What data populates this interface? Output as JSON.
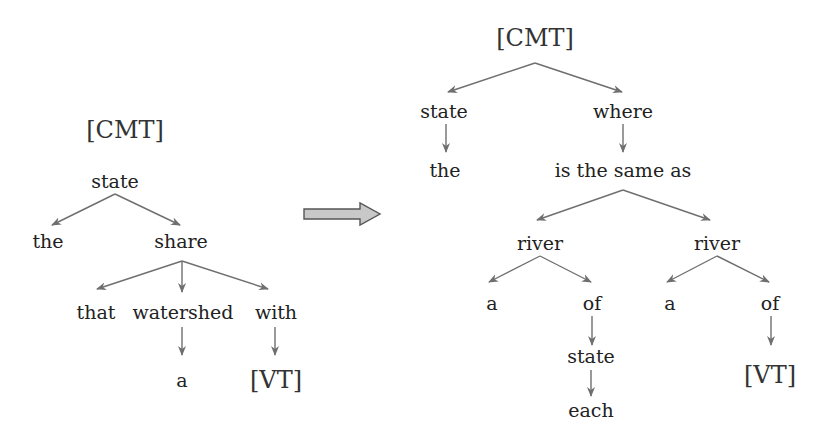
{
  "colors": {
    "edge": "#6f6f6f",
    "arrow_fill": "#c4c4c4",
    "arrow_stroke": "#555555",
    "text": "#222222"
  },
  "left_tree": {
    "label": "[CMT]",
    "nodes": [
      {
        "id": "l_root",
        "text": "state",
        "x": 115,
        "y": 181
      },
      {
        "id": "l_the",
        "text": "the",
        "x": 48,
        "y": 241
      },
      {
        "id": "l_share",
        "text": "share",
        "x": 181,
        "y": 241
      },
      {
        "id": "l_that",
        "text": "that",
        "x": 96,
        "y": 312
      },
      {
        "id": "l_watershed",
        "text": "watershed",
        "x": 183,
        "y": 312
      },
      {
        "id": "l_with",
        "text": "with",
        "x": 276,
        "y": 312
      },
      {
        "id": "l_a",
        "text": "a",
        "x": 182,
        "y": 380
      },
      {
        "id": "l_vt",
        "text": "[VT]",
        "x": 276,
        "y": 380,
        "big": true
      }
    ],
    "edges": [
      {
        "from": [
          115,
          194
        ],
        "to": [
          52,
          225
        ]
      },
      {
        "from": [
          115,
          194
        ],
        "to": [
          180,
          225
        ]
      },
      {
        "from": [
          182,
          261
        ],
        "to": [
          97,
          289
        ]
      },
      {
        "from": [
          182,
          261
        ],
        "to": [
          182,
          292
        ]
      },
      {
        "from": [
          182,
          261
        ],
        "to": [
          268,
          289
        ]
      },
      {
        "from": [
          182,
          327
        ],
        "to": [
          182,
          355
        ]
      },
      {
        "from": [
          275,
          327
        ],
        "to": [
          275,
          355
        ]
      }
    ]
  },
  "transform_arrow": {
    "label": "transform-arrow"
  },
  "right_tree": {
    "nodes": [
      {
        "id": "r_root",
        "text": "[CMT]",
        "x": 535,
        "y": 38,
        "big": true
      },
      {
        "id": "r_state",
        "text": "state",
        "x": 444,
        "y": 111
      },
      {
        "id": "r_where",
        "text": "where",
        "x": 623,
        "y": 111
      },
      {
        "id": "r_the",
        "text": "the",
        "x": 445,
        "y": 170
      },
      {
        "id": "r_same",
        "text": "is the same as",
        "x": 623,
        "y": 170
      },
      {
        "id": "r_river1",
        "text": "river",
        "x": 540,
        "y": 243
      },
      {
        "id": "r_river2",
        "text": "river",
        "x": 717,
        "y": 243
      },
      {
        "id": "r_a1",
        "text": "a",
        "x": 492,
        "y": 303
      },
      {
        "id": "r_of1",
        "text": "of",
        "x": 592,
        "y": 303
      },
      {
        "id": "r_a2",
        "text": "a",
        "x": 670,
        "y": 303
      },
      {
        "id": "r_of2",
        "text": "of",
        "x": 770,
        "y": 303
      },
      {
        "id": "r_state2",
        "text": "state",
        "x": 591,
        "y": 356
      },
      {
        "id": "r_each",
        "text": "each",
        "x": 591,
        "y": 410
      },
      {
        "id": "r_vt",
        "text": "[VT]",
        "x": 770,
        "y": 375,
        "big": true
      }
    ],
    "edges": [
      {
        "from": [
          535,
          63
        ],
        "to": [
          448,
          92
        ]
      },
      {
        "from": [
          535,
          63
        ],
        "to": [
          622,
          92
        ]
      },
      {
        "from": [
          446,
          124
        ],
        "to": [
          446,
          152
        ]
      },
      {
        "from": [
          623,
          124
        ],
        "to": [
          623,
          152
        ]
      },
      {
        "from": [
          623,
          190
        ],
        "to": [
          537,
          220
        ]
      },
      {
        "from": [
          623,
          190
        ],
        "to": [
          710,
          220
        ]
      },
      {
        "from": [
          540,
          256
        ],
        "to": [
          489,
          282
        ]
      },
      {
        "from": [
          540,
          256
        ],
        "to": [
          591,
          282
        ]
      },
      {
        "from": [
          717,
          256
        ],
        "to": [
          667,
          282
        ]
      },
      {
        "from": [
          717,
          256
        ],
        "to": [
          769,
          282
        ]
      },
      {
        "from": [
          592,
          316
        ],
        "to": [
          592,
          345
        ]
      },
      {
        "from": [
          591,
          370
        ],
        "to": [
          591,
          396
        ]
      },
      {
        "from": [
          771,
          316
        ],
        "to": [
          771,
          345
        ]
      }
    ]
  }
}
